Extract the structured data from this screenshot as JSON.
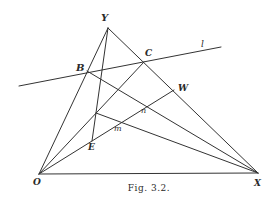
{
  "figure": {
    "caption": "Fig. 3.2.",
    "stroke_color": "#333333",
    "points": {
      "Y": {
        "label": "Y",
        "x": 108,
        "y": 28
      },
      "O": {
        "label": "O",
        "x": 39,
        "y": 174
      },
      "X": {
        "label": "X",
        "x": 258,
        "y": 173
      },
      "B": {
        "label": "B",
        "x": 87,
        "y": 71
      },
      "C": {
        "label": "C",
        "x": 144,
        "y": 62
      },
      "W": {
        "label": "W",
        "x": 174,
        "y": 90
      },
      "E": {
        "label": "E",
        "x": 92,
        "y": 141
      },
      "m": {
        "label": "m",
        "x": 119,
        "y": 123
      },
      "n": {
        "label": "n",
        "x": 146,
        "y": 106
      }
    },
    "line_l": {
      "label": "l",
      "from": [
        19,
        86
      ],
      "to": [
        221,
        47
      ]
    },
    "segments": [
      [
        "Y",
        "O"
      ],
      [
        "Y",
        "X"
      ],
      [
        "O",
        "X"
      ],
      [
        "Y",
        "E"
      ],
      [
        "B",
        "X"
      ],
      [
        "O",
        "C"
      ],
      [
        "O",
        "W"
      ],
      [
        "P",
        "X"
      ]
    ]
  }
}
